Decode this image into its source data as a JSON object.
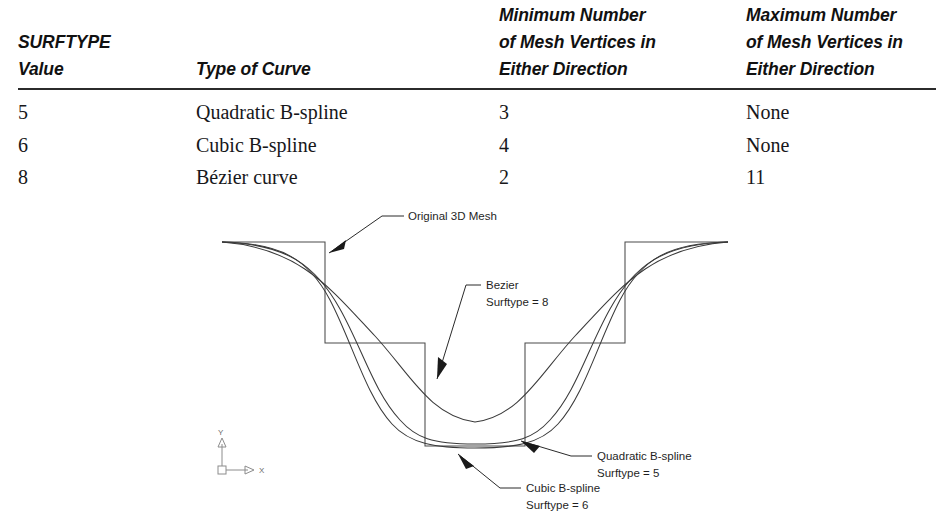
{
  "table": {
    "headers": [
      {
        "key": "value",
        "lines": [
          "SURFTYPE",
          "Value"
        ]
      },
      {
        "key": "type",
        "lines": [
          "",
          "Type of Curve"
        ]
      },
      {
        "key": "min",
        "lines": [
          "Minimum Number",
          "of Mesh Vertices in",
          "Either Direction"
        ]
      },
      {
        "key": "max",
        "lines": [
          "Maximum Number",
          "of Mesh Vertices in",
          "Either Direction"
        ]
      }
    ],
    "header_cells": {
      "value_l1": "SURFTYPE",
      "value_l2": "Value",
      "type_l1": "",
      "type_l2": "Type of Curve",
      "min_l1": "Minimum Number",
      "min_l2": "of Mesh Vertices in",
      "min_l3": "Either Direction",
      "max_l1": "Maximum Number",
      "max_l2": "of Mesh Vertices in",
      "max_l3": "Either Direction"
    },
    "rows": [
      {
        "value": "5",
        "type": "Quadratic B-spline",
        "min": "3",
        "max": "None"
      },
      {
        "value": "6",
        "type": "Cubic B-spline",
        "min": "4",
        "max": "None"
      },
      {
        "value": "8",
        "type": "Bézier curve",
        "min": "2",
        "max": "11"
      }
    ],
    "rule_color": "#2b2b2b"
  },
  "diagram": {
    "annotations": {
      "original_mesh": {
        "l1": "Original 3D Mesh",
        "l2": ""
      },
      "bezier": {
        "l1": "Bezier",
        "l2": "Surftype = 8"
      },
      "quadratic": {
        "l1": "Quadratic B-spline",
        "l2": "Surftype = 5"
      },
      "cubic": {
        "l1": "Cubic B-spline",
        "l2": "Surftype = 6"
      }
    },
    "ucs": {
      "x_label": "X",
      "y_label": "Y"
    },
    "colors": {
      "mesh_stroke": "#4a4a4a",
      "curve_stroke": "#3a3a3a",
      "leader_stroke": "#2a2a2a",
      "ucs_stroke": "#8c8c8c"
    }
  }
}
